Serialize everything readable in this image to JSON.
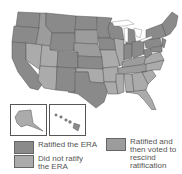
{
  "map": {
    "title": "",
    "region": "United States",
    "insets": [
      "Alaska",
      "Hawaii"
    ],
    "colors": {
      "ratified": "#8a8a8a",
      "did_not_ratify": "#ababab",
      "rescinded": "#9c9c9c",
      "water": "#ffffff",
      "border": "#555555"
    }
  },
  "legend": {
    "items": [
      {
        "label": "Ratified the ERA",
        "color": "#8a8a8a"
      },
      {
        "label": "Did not ratify the ERA",
        "color": "#ababab"
      },
      {
        "label": "Ratified and then voted to rescind ratification",
        "color": "#9c9c9c"
      }
    ]
  }
}
